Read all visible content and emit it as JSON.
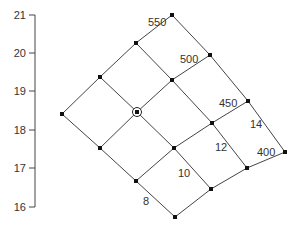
{
  "axis": {
    "ticks": [
      {
        "label": "21",
        "y": 15
      },
      {
        "label": "20",
        "y": 53
      },
      {
        "label": "19",
        "y": 91
      },
      {
        "label": "18",
        "y": 130
      },
      {
        "label": "17",
        "y": 168
      },
      {
        "label": "16",
        "y": 207
      }
    ],
    "line_x": 35,
    "range": [
      16,
      21
    ]
  },
  "grid": {
    "nodes": [
      [
        [
          62,
          114
        ],
        [
          100,
          77
        ],
        [
          136,
          43
        ],
        [
          172,
          15
        ]
      ],
      [
        [
          100,
          148
        ],
        [
          137,
          112
        ],
        [
          172,
          80
        ],
        [
          210,
          55
        ]
      ],
      [
        [
          136,
          181
        ],
        [
          174,
          148
        ],
        [
          212,
          123
        ],
        [
          248,
          101
        ]
      ],
      [
        [
          175,
          217
        ],
        [
          211,
          189
        ],
        [
          247,
          168
        ],
        [
          285,
          152
        ]
      ]
    ],
    "highlighted_node": [
      137,
      112
    ],
    "line_color": "#444444",
    "node_color": "#111111"
  },
  "labels": {
    "contour_a": [
      {
        "text": "550",
        "x": 148,
        "y": 26
      },
      {
        "text": "500",
        "x": 180,
        "y": 63
      },
      {
        "text": "450",
        "x": 219,
        "y": 107
      },
      {
        "text": "400",
        "x": 257,
        "y": 156
      }
    ],
    "contour_b": [
      {
        "text": "8",
        "x": 143,
        "y": 205
      },
      {
        "text": "10",
        "x": 178,
        "y": 177
      },
      {
        "text": "12",
        "x": 215,
        "y": 151
      },
      {
        "text": "14",
        "x": 250,
        "y": 128
      }
    ]
  }
}
